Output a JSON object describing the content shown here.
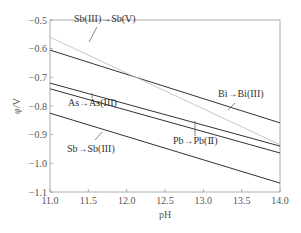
{
  "chart_data": {
    "type": "line",
    "title": "",
    "xlabel": "pH",
    "ylabel": "φ/V",
    "xlim": [
      11.0,
      14.0
    ],
    "ylim": [
      -1.1,
      -0.5
    ],
    "xticks": [
      "11.0",
      "11.5",
      "12.0",
      "12.5",
      "13.0",
      "13.5",
      "14.0"
    ],
    "yticks": [
      "-0.5",
      "-0.6",
      "-0.7",
      "-0.8",
      "-0.9",
      "-1.0",
      "-1.1"
    ],
    "grid": false,
    "legend": "inline annotations",
    "series": [
      {
        "name": "Bi→Bi(III)",
        "x": [
          11.0,
          14.0
        ],
        "values": [
          -0.605,
          -0.859
        ],
        "color": "#333333"
      },
      {
        "name": "Sb(III)→Sb(V)",
        "x": [
          11.0,
          14.0
        ],
        "values": [
          -0.56,
          -0.935
        ],
        "color": "#c8c8c8"
      },
      {
        "name": "Pb→Pb(II)",
        "x": [
          11.0,
          14.0
        ],
        "values": [
          -0.72,
          -0.94
        ],
        "color": "#333333"
      },
      {
        "name": "As→As(III)",
        "x": [
          11.0,
          14.0
        ],
        "values": [
          -0.74,
          -0.964
        ],
        "color": "#333333"
      },
      {
        "name": "Sb→Sb(III)",
        "x": [
          11.0,
          14.0
        ],
        "values": [
          -0.825,
          -1.069
        ],
        "color": "#333333"
      }
    ],
    "annotations": [
      {
        "text": "Sb(III)→Sb(Ⅴ)",
        "series": "Sb(III)→Sb(V)",
        "text_px": [
          74,
          22
        ],
        "leader": [
          [
            97,
            27
          ],
          [
            89,
            42
          ]
        ]
      },
      {
        "text": "Bi→Bi(III)",
        "series": "Bi→Bi(III)",
        "text_px": [
          218,
          97
        ],
        "leader": [
          [
            235,
            103
          ],
          [
            228,
            110
          ]
        ]
      },
      {
        "text": "As→As(III)",
        "series": "As→As(III)",
        "text_px": [
          68,
          106
        ],
        "leader": [
          [
            92,
            98
          ],
          [
            92,
            93
          ]
        ]
      },
      {
        "text": "Pb→Pb(Ⅱ)",
        "series": "Pb→Pb(II)",
        "text_px": [
          173,
          144
        ],
        "leader": [
          [
            195,
            136
          ],
          [
            195,
            121
          ]
        ]
      },
      {
        "text": "Sb→Sb(III)",
        "series": "Sb→Sb(III)",
        "text_px": [
          67,
          152
        ],
        "leader": [
          [
            95,
            140
          ],
          [
            102,
            132
          ]
        ]
      }
    ]
  }
}
